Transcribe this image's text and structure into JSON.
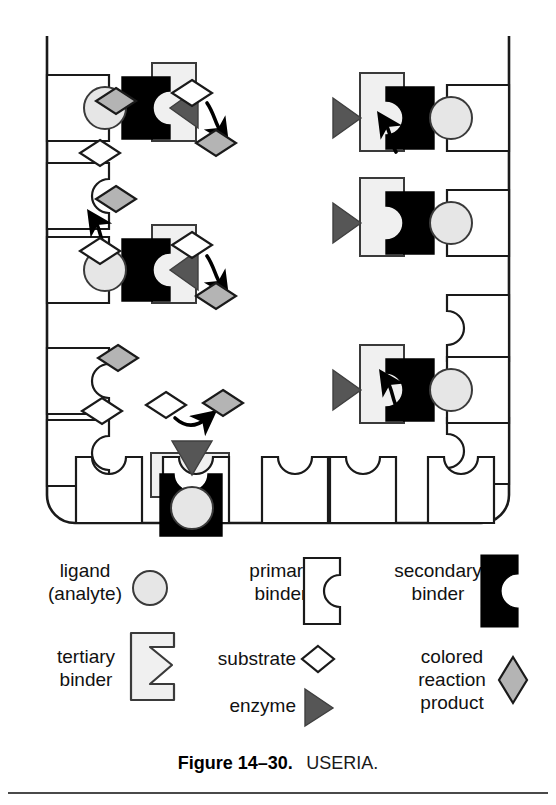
{
  "figure": {
    "caption_bold": "Figure 14–30.",
    "caption_regular": "USERIA.",
    "assay_name": "USERIA"
  },
  "colors": {
    "ligand_fill": "#e6e6e6",
    "secondary_binder_fill": "#000000",
    "tertiary_binder_fill": "#f0f0f0",
    "enzyme_fill": "#565656",
    "substrate_fill": "#ffffff",
    "product_fill": "#b4b4b4",
    "primary_binder_fill": "#ffffff",
    "outline": "#1a1a1a",
    "background": "#ffffff"
  },
  "legend": {
    "items": [
      {
        "id": "ligand",
        "label_line1": "ligand",
        "label_line2": "(analyte)",
        "icon": "circle-icon"
      },
      {
        "id": "primary-binder",
        "label_line1": "primary",
        "label_line2": "binder",
        "icon": "notched-rect-outline-icon"
      },
      {
        "id": "secondary-binder",
        "label_line1": "secondary",
        "label_line2": "binder",
        "icon": "notched-rect-black-icon"
      },
      {
        "id": "tertiary-binder",
        "label_line1": "tertiary",
        "label_line2": "binder",
        "icon": "bracket-icon"
      },
      {
        "id": "substrate",
        "label_line1": "substrate",
        "label_line2": "",
        "icon": "diamond-outline-icon"
      },
      {
        "id": "enzyme",
        "label_line1": "enzyme",
        "label_line2": "",
        "icon": "triangle-icon"
      },
      {
        "id": "product",
        "label_line1": "colored",
        "label_line2": "reaction",
        "label_line3": "product",
        "icon": "diamond-gray-icon"
      }
    ]
  },
  "vessel": {
    "description": "reaction vessel wall",
    "empty_socket_count_left": 2,
    "empty_socket_count_right": 1,
    "empty_socket_count_bottom": 4
  },
  "complexes": [
    {
      "id": "left-top",
      "orientation": "left-wall",
      "reaction": "substrate-to-product",
      "arrow": "down"
    },
    {
      "id": "left-middle",
      "orientation": "left-wall",
      "reaction": "substrate-to-product",
      "arrow": "down"
    },
    {
      "id": "right-top",
      "orientation": "right-wall",
      "reaction": "substrate-to-product",
      "arrow": "up"
    },
    {
      "id": "right-middle",
      "orientation": "right-wall",
      "reaction": "substrate-to-product",
      "arrow": "up"
    },
    {
      "id": "right-lower",
      "orientation": "right-wall",
      "reaction": "substrate-to-product",
      "arrow": "up"
    },
    {
      "id": "bottom",
      "orientation": "bottom-wall",
      "reaction": "substrate-to-product",
      "arrow": "up-right"
    }
  ]
}
